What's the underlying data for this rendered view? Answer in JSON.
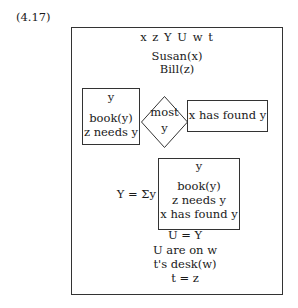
{
  "equation_number": "(4.17)",
  "drs": {
    "universe": "x z Y U w t",
    "conditions_top": [
      "Susan(x)",
      "Bill(z)"
    ],
    "duplex": {
      "restrictor": {
        "universe": "y",
        "conditions": [
          "book(y)",
          "z needs y"
        ]
      },
      "quantifier": {
        "label": "most",
        "variable": "y"
      },
      "scope": {
        "conditions": [
          "x has found y"
        ]
      }
    },
    "abstraction": {
      "lhs": "Y = Σy",
      "box": {
        "universe": "y",
        "conditions": [
          "book(y)",
          "z needs y",
          "x has found y"
        ]
      }
    },
    "conditions_bottom": [
      "U = Y",
      "U are on w",
      "t's desk(w)",
      "t = z"
    ]
  }
}
